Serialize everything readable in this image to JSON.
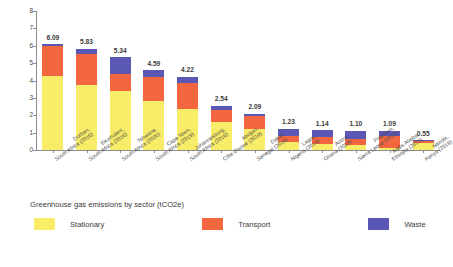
{
  "chart_data": {
    "type": "bar",
    "subtype": "stacked-vertical",
    "title": "",
    "xlabel": "",
    "ylabel": "",
    "ylim": [
      0,
      8
    ],
    "yticks": [
      "0",
      "1",
      "2",
      "3",
      "4",
      "5",
      "6",
      "7",
      "8"
    ],
    "grid": false,
    "legend_position": "bottom",
    "legend_title": "Greenhouse gas emissions by sector (tCO2e)",
    "categories": [
      "Durban, South Africa (2016)",
      "Ekurhuleni, South Africa (2016)",
      "Tshwane, South Africa (2020)",
      "Cape Town, South Africa (2019)",
      "Johannesburg, South Africa (2016)",
      "Abidjan, Côte d'Ivoire (2019)",
      "Dakar, Senegal (2016)",
      "Lagos, Nigeria (2019)",
      "Accra, Ghana (2018)",
      "Freetown, Sierra Leone (2018)",
      "Addis Ababa, Ethiopia (2021)",
      "Nairobi, Kenya (2019)"
    ],
    "category_lines": [
      [
        "Durban,",
        "South Africa (2016)"
      ],
      [
        "Ekurhuleni,",
        "South Africa (2016)"
      ],
      [
        "Tshwane,",
        "South Africa (2020)"
      ],
      [
        "Cape Town,",
        "South Africa (2019)"
      ],
      [
        "Johannesburg,",
        "South Africa (2016)"
      ],
      [
        "Abidjan,",
        "Côte d'Ivoire (2019)"
      ],
      [
        "Dakar,",
        "Senegal (2016)"
      ],
      [
        "Lagos,",
        "Nigeria (2019)"
      ],
      [
        "Accra,",
        "Ghana (2018)"
      ],
      [
        "Freetown,",
        "Sierra Leone (2018)"
      ],
      [
        "Addis Ababa,",
        "Ethiopia (2021)"
      ],
      [
        "Nairobi,",
        "Kenya (2019)"
      ]
    ],
    "totals": [
      6.09,
      5.83,
      5.34,
      4.59,
      4.22,
      2.54,
      2.09,
      1.23,
      1.14,
      1.1,
      1.09,
      0.55
    ],
    "total_labels": [
      "6.09",
      "5.83",
      "5.34",
      "4.59",
      "4.22",
      "2.54",
      "2.09",
      "1.23",
      "1.14",
      "1.10",
      "1.09",
      "0.55"
    ],
    "series": [
      {
        "name": "Stationary",
        "color": "#f8ec68",
        "values": [
          4.27,
          3.77,
          3.41,
          2.81,
          2.34,
          1.6,
          1.22,
          0.46,
          0.36,
          0.27,
          0.13,
          0.42
        ]
      },
      {
        "name": "Transport",
        "color": "#f4663f",
        "values": [
          1.74,
          1.77,
          0.97,
          1.38,
          1.49,
          0.69,
          0.72,
          0.37,
          0.38,
          0.36,
          0.65,
          0.09
        ]
      },
      {
        "name": "Waste",
        "color": "#5b57b5",
        "values": [
          0.08,
          0.29,
          0.96,
          0.4,
          0.39,
          0.25,
          0.15,
          0.4,
          0.4,
          0.47,
          0.31,
          0.04
        ]
      }
    ]
  },
  "legend": {
    "title": "Greenhouse gas emissions by sector (tCO2e)",
    "items": [
      {
        "label": "Stationary",
        "color": "#f8ec68"
      },
      {
        "label": "Transport",
        "color": "#f4663f"
      },
      {
        "label": "Waste",
        "color": "#5b57b5"
      }
    ]
  }
}
